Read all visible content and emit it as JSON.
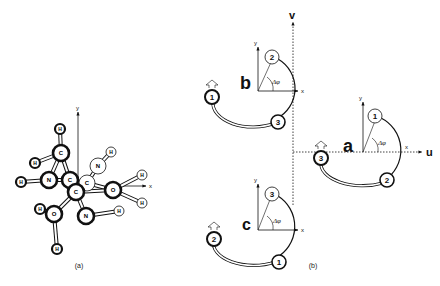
{
  "figure": {
    "panel_a": {
      "caption": "(a)",
      "axes": {
        "x": "x",
        "y": "y"
      },
      "atoms": [
        {
          "id": "H1",
          "label": "H",
          "style": "bold"
        },
        {
          "id": "H2",
          "label": "H",
          "style": "bold"
        },
        {
          "id": "C1",
          "label": "C",
          "style": "bold"
        },
        {
          "id": "H3",
          "label": "H",
          "style": "bold"
        },
        {
          "id": "N1",
          "label": "N",
          "style": "bold"
        },
        {
          "id": "C2",
          "label": "C",
          "style": "bold"
        },
        {
          "id": "C3",
          "label": "C",
          "style": "light"
        },
        {
          "id": "C4",
          "label": "C",
          "style": "bold"
        },
        {
          "id": "N2",
          "label": "N",
          "style": "light"
        },
        {
          "id": "H4",
          "label": "H",
          "style": "light"
        },
        {
          "id": "H5",
          "label": "H",
          "style": "light"
        },
        {
          "id": "O1",
          "label": "O",
          "style": "bold"
        },
        {
          "id": "H6",
          "label": "H",
          "style": "light"
        },
        {
          "id": "H7",
          "label": "H",
          "style": "light"
        },
        {
          "id": "O2",
          "label": "O",
          "style": "bold"
        },
        {
          "id": "N3",
          "label": "N",
          "style": "bold"
        },
        {
          "id": "H8",
          "label": "H",
          "style": "bold"
        },
        {
          "id": "H9",
          "label": "H",
          "style": "bold"
        }
      ]
    },
    "panel_b": {
      "caption": "(b)",
      "global_axes": {
        "u": "u",
        "v": "v"
      },
      "subpanels": [
        {
          "id": "a",
          "label": "a",
          "axes": {
            "x": "x",
            "y": "y"
          },
          "angle": "Δφ",
          "top_site": "1",
          "bottom_site": "2",
          "left_site": "3"
        },
        {
          "id": "b",
          "label": "b",
          "axes": {
            "x": "x",
            "y": "y"
          },
          "angle": "Δφ",
          "top_site": "2",
          "bottom_site": "3",
          "left_site": "1"
        },
        {
          "id": "c",
          "label": "c",
          "axes": {
            "x": "x",
            "y": "y"
          },
          "angle": "Δφ",
          "top_site": "3",
          "bottom_site": "1",
          "left_site": "2"
        }
      ]
    }
  }
}
